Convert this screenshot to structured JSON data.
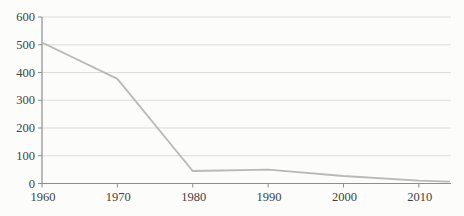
{
  "chart_data": {
    "type": "line",
    "title": "",
    "xlabel": "",
    "ylabel": "",
    "x": [
      1960,
      1970,
      1980,
      1990,
      2000,
      2010,
      2014
    ],
    "series": [
      {
        "name": "series-1",
        "values": [
          508,
          377,
          45,
          50,
          27,
          10,
          7
        ]
      }
    ],
    "xticks": [
      "1960",
      "1970",
      "1980",
      "1990",
      "2000",
      "2010"
    ],
    "yticks": [
      "0",
      "100",
      "200",
      "300",
      "400",
      "500",
      "600"
    ],
    "xlim": [
      1960,
      2014
    ],
    "ylim": [
      0,
      600
    ],
    "grid": true,
    "legend": "none",
    "colors": {
      "line": "#b7bab6",
      "grid": "#dcdcda",
      "axis": "#8e8e8c",
      "text": "#434341",
      "background": "#fcfcfb"
    }
  }
}
